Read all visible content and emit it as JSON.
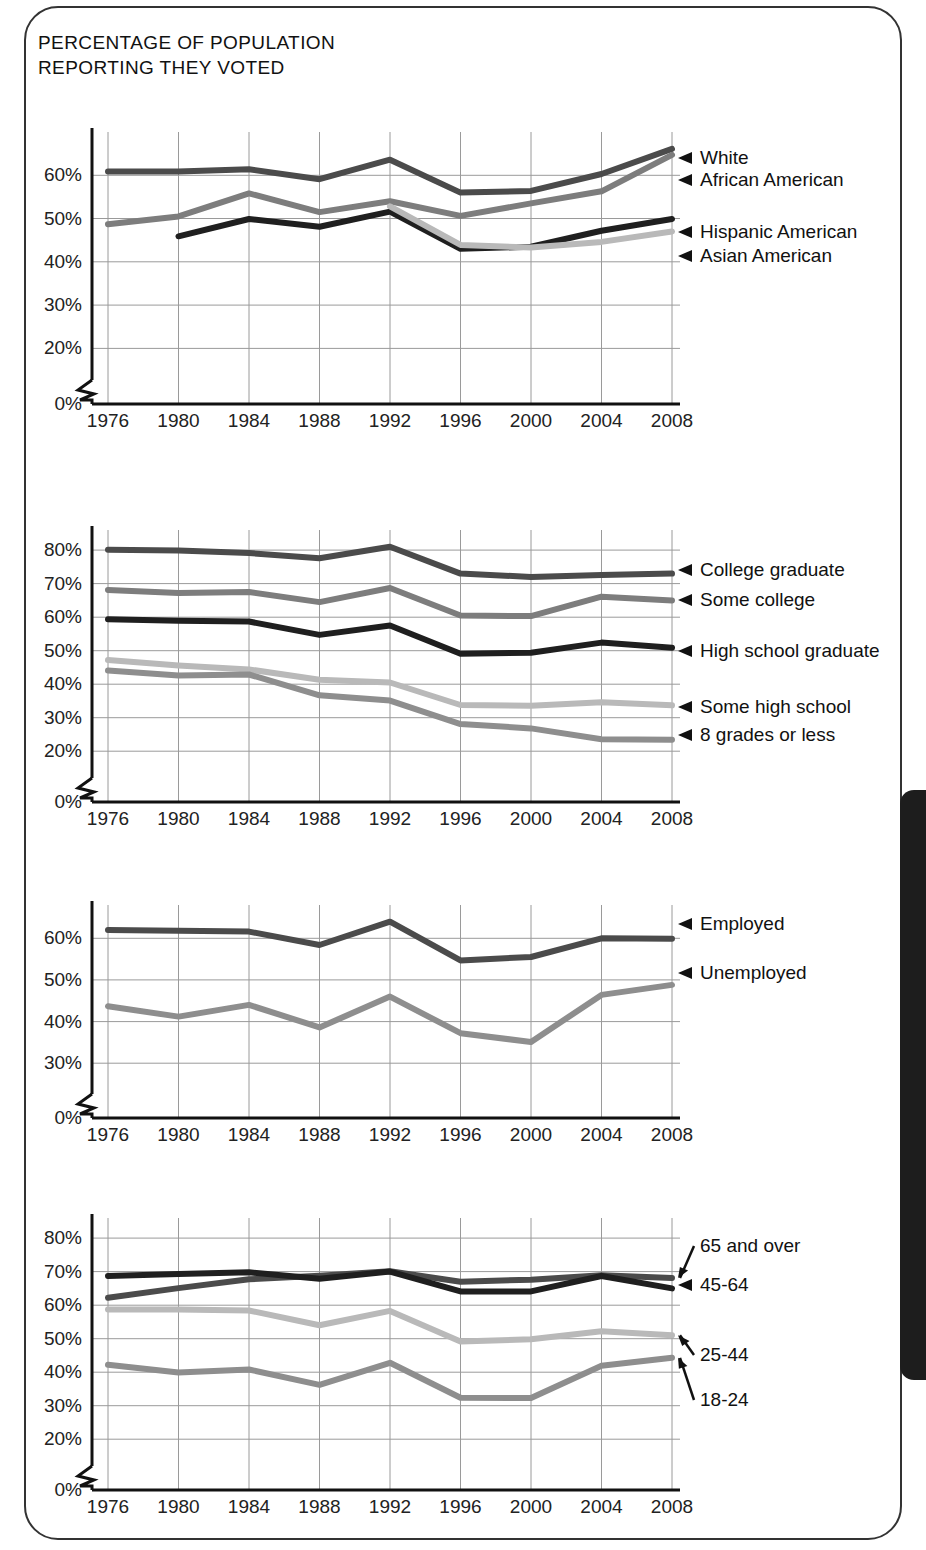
{
  "page": {
    "title": "PERCENTAGE OF POPULATION\nREPORTING THEY VOTED",
    "edge_tab_color": "#1d1d1d",
    "frame_color": "#333333"
  },
  "chart_data": [
    {
      "id": "race",
      "type": "line",
      "title": "",
      "xlabel": "",
      "ylabel": "",
      "x": [
        1976,
        1980,
        1984,
        1988,
        1992,
        1996,
        2000,
        2004,
        2008
      ],
      "ticklabels": [
        "1976",
        "1980",
        "1984",
        "1988",
        "1992",
        "1996",
        "2000",
        "2004",
        "2008"
      ],
      "yticks": [
        0,
        20,
        30,
        40,
        50,
        60
      ],
      "yticklabels": [
        "0%",
        "20%",
        "30%",
        "40%",
        "50%",
        "60%"
      ],
      "ylim": [
        15,
        70
      ],
      "axis_break": true,
      "grid": true,
      "legend_position": "right-arrows",
      "series": [
        {
          "name": "White",
          "color": "#4b4b4b",
          "values": [
            60.9,
            60.9,
            61.4,
            59.1,
            63.6,
            56.0,
            56.4,
            60.3,
            66.1
          ]
        },
        {
          "name": "African American",
          "color": "#7d7d7d",
          "values": [
            48.7,
            50.5,
            55.8,
            51.5,
            54.0,
            50.6,
            53.5,
            56.3,
            64.7
          ]
        },
        {
          "name": "Hispanic American",
          "color": "#1f1f1f",
          "values": [
            null,
            45.9,
            49.9,
            48.1,
            51.6,
            43.0,
            43.5,
            47.2,
            49.9
          ]
        },
        {
          "name": "Asian American",
          "color": "#b9b9b9",
          "values": [
            null,
            null,
            null,
            null,
            52.8,
            43.9,
            43.3,
            44.6,
            47.0
          ]
        }
      ]
    },
    {
      "id": "education",
      "type": "line",
      "title": "",
      "xlabel": "",
      "ylabel": "",
      "x": [
        1976,
        1980,
        1984,
        1988,
        1992,
        1996,
        2000,
        2004,
        2008
      ],
      "ticklabels": [
        "1976",
        "1980",
        "1984",
        "1988",
        "1992",
        "1996",
        "2000",
        "2004",
        "2008"
      ],
      "yticks": [
        0,
        20,
        30,
        40,
        50,
        60,
        70,
        80
      ],
      "yticklabels": [
        "0%",
        "20%",
        "30%",
        "40%",
        "50%",
        "60%",
        "70%",
        "80%"
      ],
      "ylim": [
        15,
        86
      ],
      "axis_break": true,
      "grid": true,
      "legend_position": "right-arrows",
      "series": [
        {
          "name": "College graduate",
          "color": "#4b4b4b",
          "values": [
            80.1,
            79.9,
            79.1,
            77.6,
            81.0,
            73.0,
            72.0,
            72.6,
            73.0
          ]
        },
        {
          "name": "Some college",
          "color": "#7d7d7d",
          "values": [
            68.1,
            67.2,
            67.5,
            64.5,
            68.7,
            60.5,
            60.3,
            66.1,
            65.0
          ]
        },
        {
          "name": "High school graduate",
          "color": "#1f1f1f",
          "values": [
            59.4,
            58.9,
            58.7,
            54.7,
            57.5,
            49.1,
            49.4,
            52.4,
            50.9
          ]
        },
        {
          "name": "Some high school",
          "color": "#b9b9b9",
          "values": [
            47.2,
            45.6,
            44.4,
            41.3,
            40.5,
            33.8,
            33.6,
            34.6,
            33.7
          ]
        },
        {
          "name": "8 grades or less",
          "color": "#8e8e8e",
          "values": [
            44.1,
            42.6,
            42.9,
            36.7,
            35.1,
            28.1,
            26.8,
            23.6,
            23.4
          ]
        }
      ]
    },
    {
      "id": "employment",
      "type": "line",
      "title": "",
      "xlabel": "",
      "ylabel": "",
      "x": [
        1976,
        1980,
        1984,
        1988,
        1992,
        1996,
        2000,
        2004,
        2008
      ],
      "ticklabels": [
        "1976",
        "1980",
        "1984",
        "1988",
        "1992",
        "1996",
        "2000",
        "2004",
        "2008"
      ],
      "yticks": [
        0,
        30,
        40,
        50,
        60
      ],
      "yticklabels": [
        "0%",
        "30%",
        "40%",
        "50%",
        "60%"
      ],
      "ylim": [
        25,
        68
      ],
      "axis_break": true,
      "grid": true,
      "legend_position": "right-arrows",
      "series": [
        {
          "name": "Employed",
          "color": "#4b4b4b",
          "values": [
            62.0,
            61.8,
            61.6,
            58.4,
            64.0,
            54.7,
            55.5,
            60.0,
            59.9
          ]
        },
        {
          "name": "Unemployed",
          "color": "#8e8e8e",
          "values": [
            43.7,
            41.2,
            44.0,
            38.6,
            46.0,
            37.2,
            35.1,
            46.4,
            48.8
          ]
        }
      ]
    },
    {
      "id": "age",
      "type": "line",
      "title": "",
      "xlabel": "",
      "ylabel": "",
      "x": [
        1976,
        1980,
        1984,
        1988,
        1992,
        1996,
        2000,
        2004,
        2008
      ],
      "ticklabels": [
        "1976",
        "1980",
        "1984",
        "1988",
        "1992",
        "1996",
        "2000",
        "2004",
        "2008"
      ],
      "yticks": [
        0,
        20,
        30,
        40,
        50,
        60,
        70,
        80
      ],
      "yticklabels": [
        "0%",
        "20%",
        "30%",
        "40%",
        "50%",
        "60%",
        "70%",
        "80%"
      ],
      "ylim": [
        15,
        86
      ],
      "axis_break": true,
      "grid": true,
      "legend_position": "right-arrows",
      "series": [
        {
          "name": "65 and over",
          "color": "#4b4b4b",
          "values": [
            62.2,
            65.1,
            67.7,
            68.8,
            70.1,
            67.0,
            67.6,
            68.9,
            68.1
          ]
        },
        {
          "name": "45-64",
          "color": "#1f1f1f",
          "values": [
            68.7,
            69.3,
            69.8,
            67.9,
            70.0,
            64.1,
            64.1,
            68.7,
            65.0
          ]
        },
        {
          "name": "25-44",
          "color": "#b9b9b9",
          "values": [
            58.7,
            58.7,
            58.4,
            54.0,
            58.3,
            49.2,
            49.8,
            52.2,
            51.0
          ]
        },
        {
          "name": "18-24",
          "color": "#8e8e8e",
          "values": [
            42.2,
            39.9,
            40.8,
            36.2,
            42.8,
            32.4,
            32.3,
            41.9,
            44.3
          ]
        }
      ]
    }
  ]
}
